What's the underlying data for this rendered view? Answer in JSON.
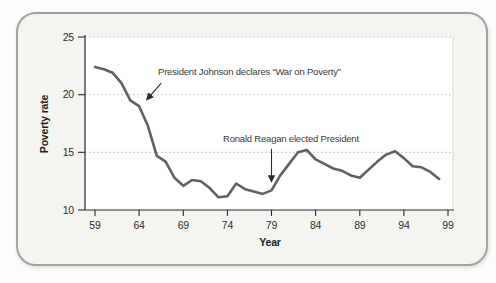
{
  "colors": {
    "card_background": "#f4f4f1",
    "card_border": "#a2a2a2",
    "plot_background": "#ffffff",
    "gridline": "#c9c9c9",
    "axis": "#2b2b2b",
    "line": "#616161",
    "annotation": "#3a3a3a"
  },
  "chart_data": {
    "type": "line",
    "title": "",
    "xlabel": "Year",
    "ylabel": "Poverty rate",
    "xlim": [
      1959,
      1999
    ],
    "ylim": [
      10,
      25
    ],
    "grid": "dotted horizontal gridlines at 15, 20, 25",
    "legend": "none",
    "x_tick_labels": [
      "59",
      "64",
      "69",
      "74",
      "79",
      "84",
      "89",
      "94",
      "99"
    ],
    "y_tick_labels": [
      "10",
      "15",
      "20",
      "25"
    ],
    "series": [
      {
        "name": "U.S. poverty rate (%)",
        "x": [
          1959,
          1960,
          1961,
          1962,
          1963,
          1964,
          1965,
          1966,
          1967,
          1968,
          1969,
          1970,
          1971,
          1972,
          1973,
          1974,
          1975,
          1976,
          1977,
          1978,
          1979,
          1980,
          1981,
          1982,
          1983,
          1984,
          1985,
          1986,
          1987,
          1988,
          1989,
          1990,
          1991,
          1992,
          1993,
          1994,
          1995,
          1996,
          1997,
          1998
        ],
        "values": [
          22.4,
          22.2,
          21.9,
          21.0,
          19.5,
          19.0,
          17.3,
          14.7,
          14.2,
          12.8,
          12.1,
          12.6,
          12.5,
          11.9,
          11.1,
          11.2,
          12.3,
          11.8,
          11.6,
          11.4,
          11.7,
          13.0,
          14.0,
          15.0,
          15.2,
          14.4,
          14.0,
          13.6,
          13.4,
          13.0,
          12.8,
          13.5,
          14.2,
          14.8,
          15.1,
          14.5,
          13.8,
          13.7,
          13.3,
          12.7
        ]
      }
    ],
    "annotations": [
      {
        "text": "President Johnson declares “War on Poverty”",
        "arrow": {
          "x1": 1966.5,
          "y1": 21.0,
          "x2": 1964.9,
          "y2": 19.6
        }
      },
      {
        "text": "Ronald Reagan elected President",
        "arrow": {
          "x1": 1979.0,
          "y1": 15.3,
          "x2": 1979.0,
          "y2": 12.5
        }
      }
    ]
  }
}
